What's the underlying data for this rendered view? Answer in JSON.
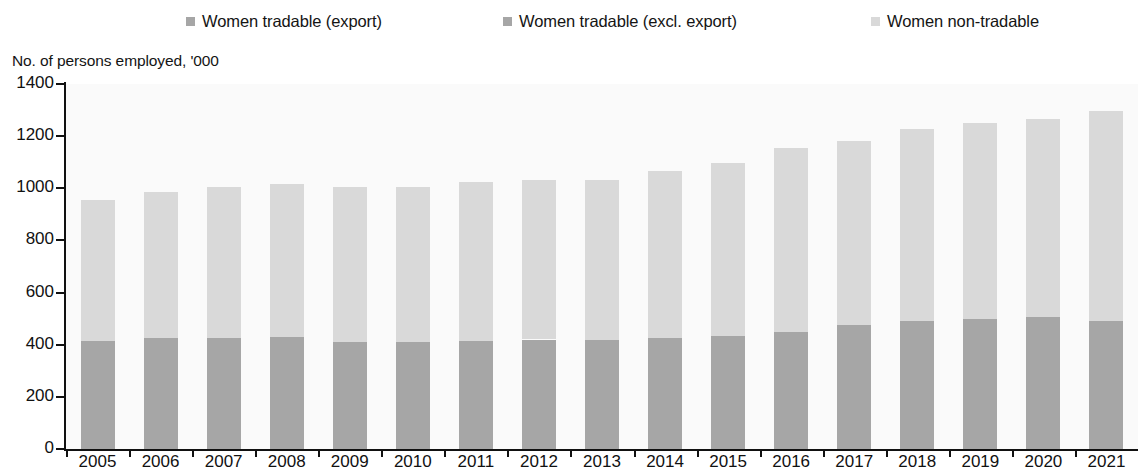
{
  "legend": {
    "items": [
      {
        "label": "Women tradable (export)",
        "color": "#a6a6a6"
      },
      {
        "label": "Women tradable (excl. export)",
        "color": "#a6a6a6"
      },
      {
        "label": "Women non-tradable",
        "color": "#d9d9d9"
      }
    ]
  },
  "axis_title": "No. of persons employed, '000",
  "chart_data": {
    "type": "bar",
    "stacked": true,
    "title": "",
    "subtitle": "",
    "xlabel": "",
    "ylabel": "No. of persons employed, '000",
    "ylim": [
      0,
      1400
    ],
    "ytick_labels": [
      "0",
      "200",
      "400",
      "600",
      "800",
      "1000",
      "1200",
      "1400"
    ],
    "ytick_values": [
      0,
      200,
      400,
      600,
      800,
      1000,
      1200,
      1400
    ],
    "grid": false,
    "legend_position": "top",
    "categories": [
      "2005",
      "2006",
      "2007",
      "2008",
      "2009",
      "2010",
      "2011",
      "2012",
      "2013",
      "2014",
      "2015",
      "2016",
      "2017",
      "2018",
      "2019",
      "2020",
      "2021"
    ],
    "series": [
      {
        "name": "Women tradable (export)",
        "color": "#a6a6a6",
        "values": [
          0,
          0,
          0,
          0,
          0,
          0,
          0,
          0,
          0,
          0,
          0,
          0,
          0,
          0,
          0,
          0,
          0
        ]
      },
      {
        "name": "Women tradable (excl. export)",
        "color": "#a6a6a6",
        "values": [
          415,
          425,
          425,
          430,
          412,
          410,
          415,
          420,
          418,
          425,
          432,
          448,
          475,
          492,
          500,
          505,
          490
        ]
      },
      {
        "name": "Women non-tradable",
        "color": "#d9d9d9",
        "values": [
          540,
          562,
          580,
          585,
          592,
          595,
          608,
          612,
          615,
          640,
          665,
          705,
          705,
          735,
          752,
          760,
          805
        ]
      }
    ],
    "totals": [
      955,
      987,
      1005,
      1015,
      1004,
      1005,
      1023,
      1032,
      1033,
      1065,
      1097,
      1153,
      1180,
      1227,
      1252,
      1265,
      1295
    ]
  },
  "colors": {
    "tradable_export": "#a6a6a6",
    "tradable_excl_export": "#a6a6a6",
    "non_tradable": "#d9d9d9",
    "axis": "#111111",
    "plot_background": "#fafafa"
  }
}
